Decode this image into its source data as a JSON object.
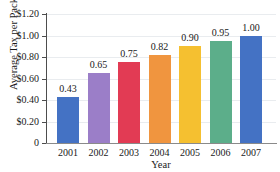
{
  "chart_data": {
    "type": "bar",
    "title": "",
    "xlabel": "Year",
    "ylabel": "Average Tax per Pack",
    "categories": [
      "2001",
      "2002",
      "2003",
      "2004",
      "2005",
      "2006",
      "2007"
    ],
    "values": [
      0.43,
      0.65,
      0.75,
      0.82,
      0.9,
      0.95,
      1.0
    ],
    "value_labels": [
      "0.43",
      "0.65",
      "0.75",
      "0.82",
      "0.90",
      "0.95",
      "1.00"
    ],
    "ylim": [
      0,
      1.2
    ],
    "ytick_values": [
      1.2,
      1.0,
      0.8,
      0.6,
      0.4,
      0.2,
      0
    ],
    "ytick_labels": [
      "$1.20",
      "$1.00",
      "$0.80",
      "$0.60",
      "$0.40",
      "$0.20",
      "0"
    ],
    "grid": true,
    "legend": false,
    "bar_colors": [
      "#4472c4",
      "#9b7ec8",
      "#e23b54",
      "#f0953f",
      "#f5c030",
      "#5cae8a",
      "#4472c4"
    ],
    "gridline_color": "#e9ecef",
    "axis_color": "#4d4d4d"
  }
}
